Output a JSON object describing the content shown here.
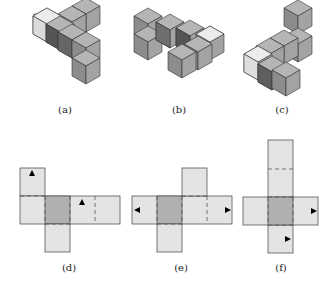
{
  "figure": {
    "labels": {
      "a": "(a)",
      "b": "(b)",
      "c": "(c)",
      "d": "(d)",
      "e": "(e)",
      "f": "(f)"
    },
    "colors": {
      "cube_light": "#e6e6e6",
      "cube_mid": "#9a9a9a",
      "cube_dark": "#6a6a6a",
      "net_face": "#e4e4e4",
      "net_base": "#b0b0b0",
      "edge": "#333333"
    }
  }
}
